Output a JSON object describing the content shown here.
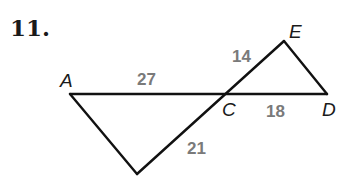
{
  "problem": {
    "number": "11."
  },
  "vertices": [
    {
      "id": "A",
      "label": "A",
      "x": 70,
      "y": 94,
      "lx": 60,
      "ly": 87
    },
    {
      "id": "B",
      "label": "B",
      "x": 137,
      "y": 174,
      "lx": 131,
      "ly": 192
    },
    {
      "id": "C",
      "label": "C",
      "x": 226,
      "y": 94,
      "lx": 222,
      "ly": 116
    },
    {
      "id": "D",
      "label": "D",
      "x": 327,
      "y": 94,
      "lx": 322,
      "ly": 116
    },
    {
      "id": "E",
      "label": "E",
      "x": 284,
      "y": 41,
      "lx": 289,
      "ly": 38
    }
  ],
  "segments": [
    {
      "id": "AD",
      "from": "A",
      "to": "D"
    },
    {
      "id": "AB",
      "from": "A",
      "to": "B"
    },
    {
      "id": "BE",
      "from": "B",
      "to": "E"
    },
    {
      "id": "ED",
      "from": "E",
      "to": "D"
    }
  ],
  "measures": {
    "AC": {
      "label": "27",
      "x": 137,
      "y": 85
    },
    "CE": {
      "label": "14",
      "x": 232,
      "y": 62
    },
    "CD": {
      "label": "18",
      "x": 266,
      "y": 117
    },
    "BC": {
      "label": "21",
      "x": 187,
      "y": 154
    }
  },
  "colors": {
    "line": "#111111",
    "vertex_label": "#1a1a1a",
    "measure_label": "#7a7a7a",
    "background": "#ffffff"
  }
}
